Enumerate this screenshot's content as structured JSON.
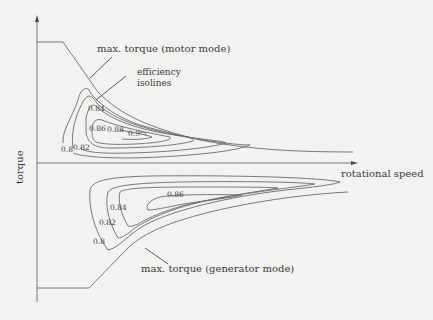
{
  "axes": {
    "x_label": "rotational speed",
    "y_label": "torque"
  },
  "annotations": {
    "motor_limit": "max. torque (motor mode)",
    "isolines_1": "efficiency",
    "isolines_2": "isolines",
    "generator_limit": "max. torque (generator mode)"
  },
  "motor_isolines": [
    "0.8",
    "0.82",
    "0.84",
    "0.86",
    "0.88",
    "0.9"
  ],
  "generator_isolines": [
    "0.8",
    "0.82",
    "0.84",
    "0.86"
  ],
  "colors": {
    "background": "#f2f2f0",
    "line": "#6a6a6a",
    "text": "#3a3a3a"
  }
}
